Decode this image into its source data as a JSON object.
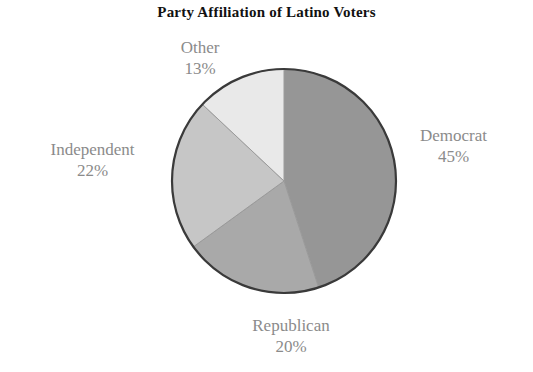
{
  "chart_data": {
    "type": "pie",
    "title": "Party Affiliation of Latino Voters",
    "xlabel": "",
    "ylabel": "",
    "legend_position": "none",
    "grid": false,
    "start_angle_deg": 0,
    "direction": "clockwise",
    "categories": [
      "Democrat",
      "Republican",
      "Independent",
      "Other"
    ],
    "values": [
      45,
      20,
      22,
      13
    ],
    "value_unit": "percent",
    "slices": [
      {
        "label": "Democrat",
        "value": 45,
        "value_text": "45%",
        "color": "#969696",
        "start_deg": 0,
        "end_deg": 162
      },
      {
        "label": "Republican",
        "value": 20,
        "value_text": "20%",
        "color": "#a9a9a9",
        "start_deg": 162,
        "end_deg": 234
      },
      {
        "label": "Independent",
        "value": 22,
        "value_text": "22%",
        "color": "#c6c6c6",
        "start_deg": 234,
        "end_deg": 313.2
      },
      {
        "label": "Other",
        "value": 13,
        "value_text": "13%",
        "color": "#e9e9e9",
        "start_deg": 313.2,
        "end_deg": 360
      }
    ]
  },
  "styling": {
    "background": "#ffffff",
    "title_color": "#111111",
    "label_color": "#8b8b8b",
    "outline_color": "#3a3a3a"
  }
}
